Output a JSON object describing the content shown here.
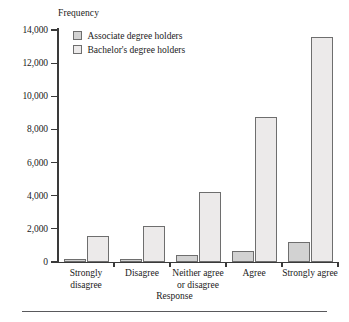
{
  "chart_data": {
    "type": "bar",
    "title": "",
    "xlabel": "Response",
    "ylabel": "Frequency",
    "categories": [
      "Strongly disagree",
      "Disagree",
      "Neither agree or disagree",
      "Agree",
      "Strongly agree"
    ],
    "category_lines": [
      [
        "Strongly",
        "disagree"
      ],
      [
        "Disagree",
        ""
      ],
      [
        "Neither agree",
        "or disagree"
      ],
      [
        "Agree",
        ""
      ],
      [
        "Strongly agree",
        ""
      ]
    ],
    "series": [
      {
        "name": "Associate degree holders",
        "color": "#d2d2d2",
        "values": [
          200,
          180,
          450,
          650,
          1200
        ]
      },
      {
        "name": "Bachelor's degree holders",
        "color": "#eceaea",
        "values": [
          1550,
          2150,
          4200,
          8750,
          13600
        ]
      }
    ],
    "ylim": [
      0,
      14000
    ],
    "ytick_values": [
      0,
      2000,
      4000,
      6000,
      8000,
      10000,
      12000,
      14000
    ],
    "ytick_labels": [
      "0",
      "2,000",
      "4,000",
      "6,000",
      "8,000",
      "10,000",
      "12,000",
      "14,000"
    ],
    "grid": false,
    "legend_position": "top-left-inside"
  },
  "legend": {
    "items": [
      {
        "label": "Associate degree holders"
      },
      {
        "label": "Bachelor's degree holders"
      }
    ]
  },
  "axes": {
    "y_title": "Frequency",
    "x_title": "Response"
  }
}
